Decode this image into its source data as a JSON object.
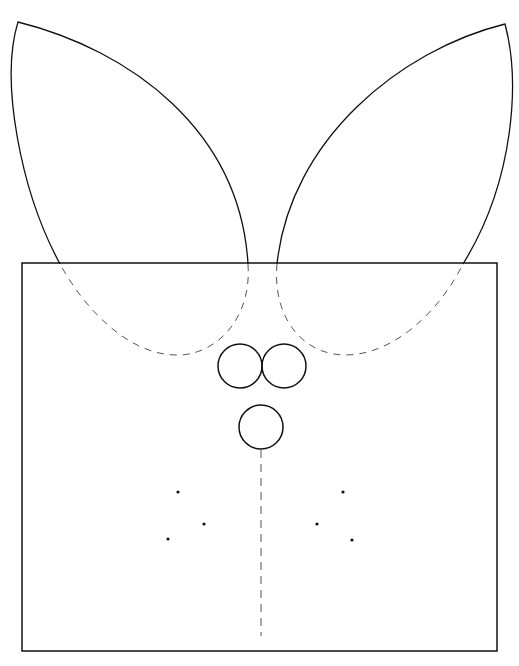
{
  "diagram": {
    "stroke_color": "#111111",
    "dash_color": "#555555",
    "background": "#ffffff",
    "body_rect": {
      "x": 22,
      "y": 263,
      "width": 475,
      "height": 388
    },
    "left_ear": {
      "tip": [
        18,
        22
      ],
      "outer_base": [
        60,
        264
      ],
      "inner_base": [
        248,
        264
      ],
      "hidden_bottom": [
        178,
        355
      ]
    },
    "right_ear": {
      "tip": [
        505,
        24
      ],
      "inner_base": [
        277,
        264
      ],
      "outer_base": [
        463,
        264
      ],
      "hidden_bottom": [
        345,
        355
      ]
    },
    "eyes": [
      {
        "cx": 240,
        "cy": 366,
        "r": 22
      },
      {
        "cx": 284,
        "cy": 366,
        "r": 22
      }
    ],
    "nose": {
      "cx": 261,
      "cy": 427,
      "r": 22
    },
    "center_line": {
      "x": 261,
      "y1": 450,
      "y2": 636
    },
    "whisker_dots": [
      {
        "cx": 178,
        "cy": 492
      },
      {
        "cx": 204,
        "cy": 524
      },
      {
        "cx": 168,
        "cy": 539
      },
      {
        "cx": 343,
        "cy": 492
      },
      {
        "cx": 317,
        "cy": 524
      },
      {
        "cx": 352,
        "cy": 540
      }
    ],
    "caption": ""
  }
}
